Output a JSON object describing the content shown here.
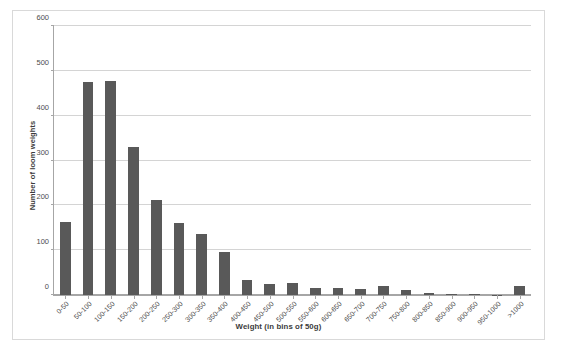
{
  "chart_data": {
    "type": "bar",
    "title": "",
    "xlabel": "Weight (in bins of 50g)",
    "ylabel": "Number of loom weights",
    "ylim": [
      0,
      600
    ],
    "yticks": [
      0,
      100,
      200,
      300,
      400,
      500,
      600
    ],
    "ytick_labels": [
      "0",
      "100",
      "200",
      "300",
      "400",
      "500",
      "600"
    ],
    "grid": true,
    "legend": false,
    "bar_color": "#595959",
    "gridline_color": "#d4d4d4",
    "axis_color": "#a6a6a6",
    "frame_color": "#d9d9d9",
    "categories": [
      "0-50",
      "50-100",
      "100-150",
      "150-200",
      "200-250",
      "250-300",
      "300-350",
      "350-400",
      "400-450",
      "450-500",
      "500-550",
      "550-600",
      "600-650",
      "650-700",
      "700-750",
      "750-800",
      "800-850",
      "850-900",
      "900-950",
      "950-1000",
      ">1000"
    ],
    "values": [
      162,
      476,
      478,
      330,
      212,
      160,
      135,
      95,
      33,
      25,
      27,
      15,
      15,
      13,
      20,
      12,
      4,
      3,
      2,
      1,
      20
    ]
  }
}
